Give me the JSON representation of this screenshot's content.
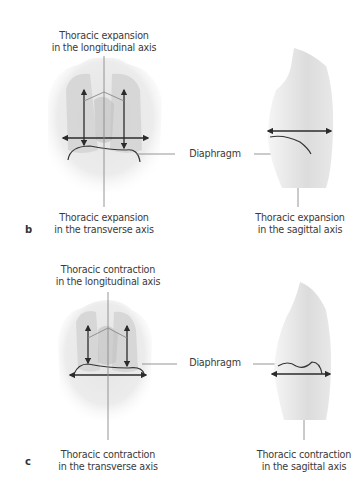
{
  "figure": {
    "panels": [
      {
        "letter": "b",
        "top_label": [
          "Thoracic expansion",
          "in the longitudinal axis"
        ],
        "diaphragm_label": "Diaphragm",
        "front_bottom_label": [
          "Thoracic expansion",
          "in the transverse axis"
        ],
        "side_bottom_label": [
          "Thoracic expansion",
          "in the sagittal axis"
        ]
      },
      {
        "letter": "c",
        "top_label": [
          "Thoracic contraction",
          "in the longitudinal axis"
        ],
        "diaphragm_label": "Diaphragm",
        "front_bottom_label": [
          "Thoracic contraction",
          "in the transverse axis"
        ],
        "side_bottom_label": [
          "Thoracic contraction",
          "in the sagittal axis"
        ]
      }
    ],
    "colors": {
      "arrow": "#2b2b2b",
      "leader_line": "#8a8a8a",
      "skin_light": "#f2f2f2",
      "skin_mid": "#d9d9d9",
      "lung_shade": "#c4c4c4"
    }
  }
}
